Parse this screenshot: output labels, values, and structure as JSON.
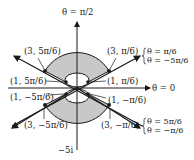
{
  "figure": {
    "axis_labels": {
      "vertical_top": "θ = π/2",
      "horizontal_right": "θ = 0",
      "vertical_bottom": "−5i"
    },
    "ray_labels": {
      "upper_right_line1": "θ = π/6",
      "upper_right_line2": "θ = −5π/6",
      "lower_right_line1": "θ = 5π/6",
      "lower_right_line2": "θ = −π/6"
    },
    "points": [
      {
        "label": "(3, 5π/6)"
      },
      {
        "label": "(3, π/6)"
      },
      {
        "label": "(1, 5π/6)"
      },
      {
        "label": "(1, π/6)"
      },
      {
        "label": "(1, −5π/6)"
      },
      {
        "label": "(1, −π/6)"
      },
      {
        "label": "(3, −5π/6)"
      },
      {
        "label": "(3, −π/6)"
      }
    ],
    "colors": {
      "shade": "#c8c8c8",
      "ink": "#1a1a1a"
    }
  }
}
